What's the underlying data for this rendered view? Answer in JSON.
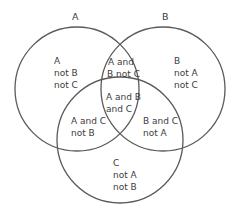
{
  "diagram": {
    "type": "venn",
    "stroke_color": "#5a5a5a",
    "text_color": "#3c3c3c",
    "sets": [
      {
        "id": "A",
        "label": "A",
        "cx": 77,
        "cy": 89,
        "r": 62
      },
      {
        "id": "B",
        "label": "B",
        "cx": 163,
        "cy": 89,
        "r": 62
      },
      {
        "id": "C",
        "label": "C",
        "cx": 120,
        "cy": 140,
        "r": 63
      }
    ],
    "regions": {
      "a_only": {
        "lines": [
          "A",
          "not B",
          "not C"
        ]
      },
      "b_only": {
        "lines": [
          "B",
          "not A",
          "not C"
        ]
      },
      "c_only": {
        "lines": [
          "C",
          "not A",
          "not B"
        ]
      },
      "a_and_b_not_c": {
        "lines": [
          "A and",
          "B not C"
        ]
      },
      "a_and_c_not_b": {
        "lines": [
          "A and C",
          "not B"
        ]
      },
      "b_and_c_not_a": {
        "lines": [
          "B and C",
          "not A"
        ]
      },
      "a_and_b_and_c": {
        "lines": [
          "A and B",
          "and C"
        ]
      }
    }
  }
}
